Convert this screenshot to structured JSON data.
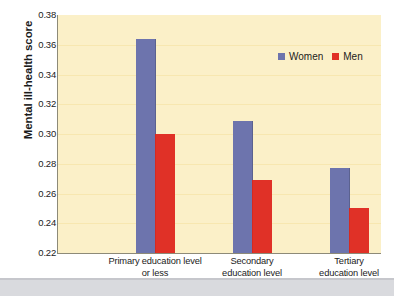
{
  "chart_data": {
    "type": "bar",
    "title": "",
    "subtitle": "",
    "xlabel": "",
    "ylabel": "Mental ill-health score",
    "ylim": [
      0.22,
      0.38
    ],
    "ytick_step": 0.02,
    "yticks": [
      "0.38",
      "0.36",
      "0.34",
      "0.32",
      "0.30",
      "0.28",
      "0.26",
      "0.24",
      "0.22"
    ],
    "ytick_values": [
      0.38,
      0.36,
      0.34,
      0.32,
      0.3,
      0.28,
      0.26,
      0.24,
      0.22
    ],
    "grid": true,
    "legend_position": "top-right",
    "categories": [
      "Primary education level or less",
      "Secondary education level",
      "Tertiary education level"
    ],
    "category_lines": [
      [
        "Primary education level",
        "or less"
      ],
      [
        "Secondary",
        "education level"
      ],
      [
        "Tertiary",
        "education level"
      ]
    ],
    "series": [
      {
        "name": "Women",
        "color": "#6d74ad",
        "values": [
          0.364,
          0.309,
          0.277
        ]
      },
      {
        "name": "Men",
        "color": "#e03127",
        "values": [
          0.3,
          0.269,
          0.25
        ]
      }
    ]
  },
  "legend": {
    "entries": [
      {
        "label": "Women",
        "color": "#6d74ad"
      },
      {
        "label": "Men",
        "color": "#e03127"
      }
    ]
  },
  "colors": {
    "plot_background": "#fbf0c8",
    "gridline": "#f7e7b0",
    "axis": "#8d8a78",
    "women": "#6d74ad",
    "men": "#e03127",
    "text": "#1b1b1b",
    "page_strip": "#d9dade"
  }
}
